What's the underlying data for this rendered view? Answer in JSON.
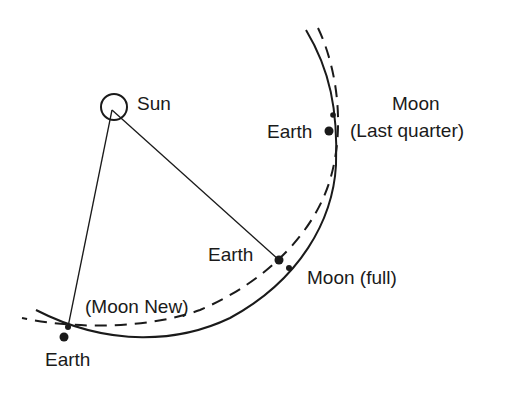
{
  "diagram": {
    "type": "orbital-geometry",
    "colors": {
      "line": "#1a1a1a",
      "background": "#ffffff"
    },
    "sun": {
      "label": "Sun",
      "x": 114,
      "y": 107,
      "r": 13
    },
    "curves": {
      "moon_orbit_solid": {
        "style": "solid",
        "description": "Moon's path"
      },
      "earth_orbit_dashed": {
        "style": "dashed",
        "description": "Earth's path"
      }
    },
    "labels": {
      "sun": "Sun",
      "moon_last_quarter_line1": "Moon",
      "moon_last_quarter_line2": "(Last quarter)",
      "earth_last_quarter": "Earth",
      "earth_full": "Earth",
      "moon_full": "Moon (full)",
      "moon_new": "(Moon New)",
      "earth_new": "Earth"
    },
    "points": [
      {
        "name": "moon-last-quarter",
        "x": 333,
        "y": 115,
        "size": "small"
      },
      {
        "name": "earth-last-quarter",
        "x": 329,
        "y": 131,
        "size": "large"
      },
      {
        "name": "earth-full",
        "x": 279,
        "y": 260,
        "size": "large"
      },
      {
        "name": "moon-full",
        "x": 289,
        "y": 268,
        "size": "small"
      },
      {
        "name": "moon-new",
        "x": 68,
        "y": 327,
        "size": "small"
      },
      {
        "name": "earth-new",
        "x": 64,
        "y": 337,
        "size": "large"
      }
    ]
  }
}
